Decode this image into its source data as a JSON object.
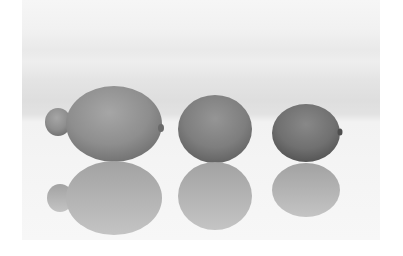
{
  "image": {
    "description": "Grayscale photograph of three citrus fruits in a row with mirror reflections",
    "subjects": [
      {
        "name": "lemon",
        "position": "left"
      },
      {
        "name": "orange",
        "position": "center"
      },
      {
        "name": "lime",
        "position": "right"
      }
    ],
    "colors": {
      "page_background": "#ffffff",
      "backdrop_top": "#f6f6f6",
      "backdrop_horizon": "#dedede",
      "surface": "#f4f4f4",
      "lemon": "#8e8e8e",
      "orange": "#7e7e7e",
      "lime": "#707070",
      "reflection": "#b4b4b4"
    }
  }
}
